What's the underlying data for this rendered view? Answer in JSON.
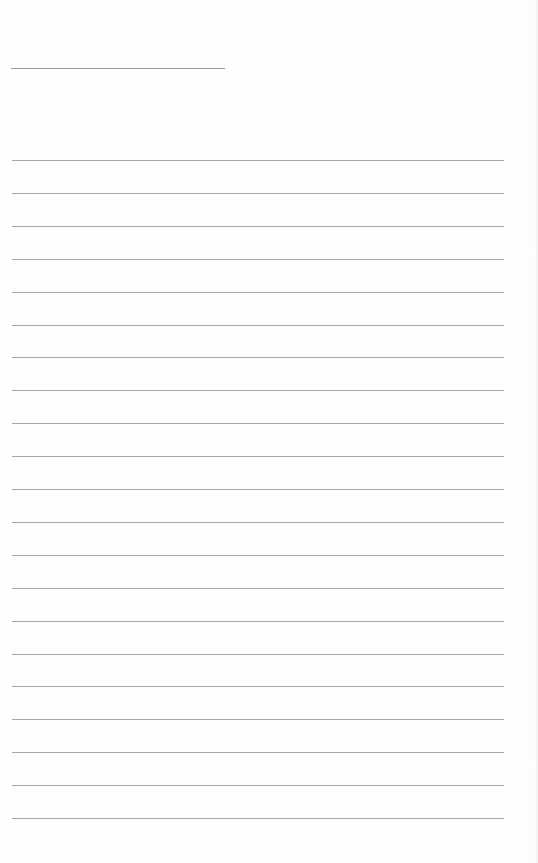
{
  "page": {
    "type": "blank lined sheet",
    "background_color": "#fdfdfd",
    "line_color": "#a8a8a8",
    "title_line": {
      "top": 68,
      "left": 11,
      "width": 214
    },
    "writing_lines": {
      "count": 21,
      "first_top": 160,
      "spacing": 32.9,
      "left": 12,
      "width": 492
    }
  }
}
